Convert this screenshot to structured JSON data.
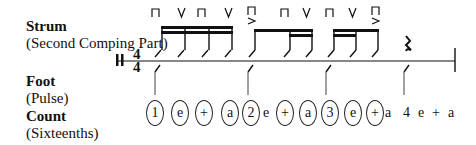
{
  "labels": {
    "strum": {
      "title": "Strum",
      "sub": "(Second Comping Part)"
    },
    "foot": {
      "title": "Foot",
      "sub": "(Pulse)"
    },
    "count": {
      "title": "Count",
      "sub": "(Sixteenths)"
    }
  },
  "time_signature": {
    "top": "4",
    "bottom": "4"
  },
  "strum_marks": [
    {
      "symbol": "down-bow",
      "accent": false
    },
    {
      "symbol": "up-bow",
      "accent": false
    },
    {
      "symbol": "down-bow",
      "accent": false
    },
    {
      "symbol": "up-bow",
      "accent": false
    },
    {
      "symbol": "down-bow",
      "accent": true
    },
    {
      "symbol": "down-bow",
      "accent": false
    },
    {
      "symbol": "up-bow",
      "accent": false
    },
    {
      "symbol": "down-bow",
      "accent": false
    },
    {
      "symbol": "up-bow",
      "accent": false
    },
    {
      "symbol": "down-bow",
      "accent": true
    }
  ],
  "rest": "quarter-rest",
  "count": [
    {
      "text": "1",
      "circled": true
    },
    {
      "text": "e",
      "circled": true
    },
    {
      "text": "+",
      "circled": true
    },
    {
      "text": "a",
      "circled": true
    },
    {
      "text": "2",
      "circled": true
    },
    {
      "text": "e",
      "circled": false
    },
    {
      "text": "+",
      "circled": true
    },
    {
      "text": "a",
      "circled": true
    },
    {
      "text": "3",
      "circled": true
    },
    {
      "text": "e",
      "circled": true
    },
    {
      "text": "+",
      "circled": true
    },
    {
      "text": "a",
      "circled": false
    },
    {
      "text": "4",
      "circled": false
    },
    {
      "text": "e",
      "circled": false
    },
    {
      "text": "+",
      "circled": false
    },
    {
      "text": "a",
      "circled": false
    }
  ]
}
